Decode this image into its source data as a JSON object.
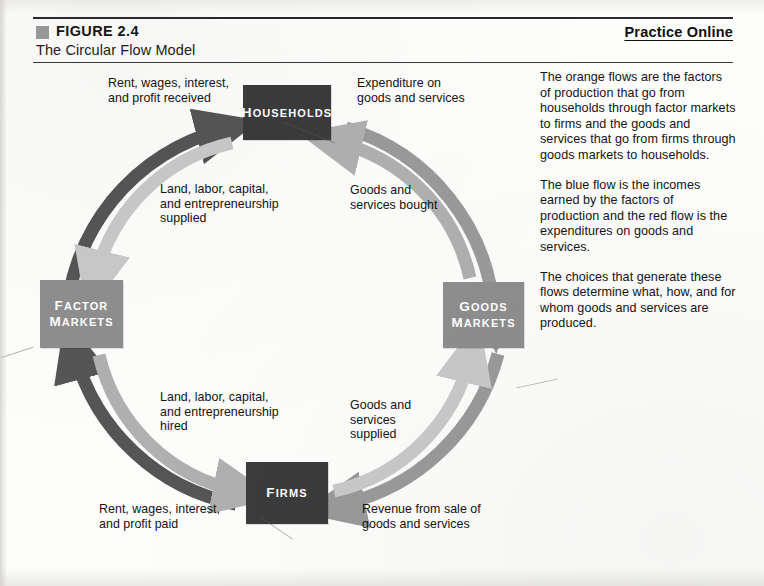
{
  "header": {
    "figure_label": "FIGURE 2.4",
    "figure_title": "The Circular Flow Model",
    "practice_online": "Practice Online"
  },
  "caption": {
    "paragraphs": [
      "The orange flows are the factors of production that go from households through factor markets to firms and the goods and services that go from firms through goods markets to households.",
      "The blue flow is the incomes earned by the factors of production and the red flow is the expenditures on goods and services.",
      "The choices that generate these flows determine what, how, and for whom goods and services are produced."
    ]
  },
  "diagram": {
    "nodes": {
      "households": "HOUSEHOLDS",
      "factor_markets": "FACTOR\nMARKETS",
      "goods_markets": "GOODS\nMARKETS",
      "firms": "FIRMS"
    },
    "flow_labels": {
      "rent_received": "Rent, wages, interest,\nand profit received",
      "expenditure": "Expenditure on\ngoods and services",
      "land_supplied": "Land, labor, capital,\nand entrepreneurship\nsupplied",
      "goods_bought": "Goods and\nservices bought",
      "land_hired": "Land, labor, capital,\nand entrepreneurship\nhired",
      "goods_supplied": "Goods and\nservices\nsupplied",
      "rent_paid": "Rent, wages, interest,\nand profit paid",
      "revenue": "Revenue from sale of\ngoods and services"
    },
    "colors": {
      "income_flow_blue": "#555555",
      "expenditure_flow_red": "#9a9a9a",
      "factors_flow_orange": "#c9c9c9",
      "goods_flow_orange": "#b0b0b0",
      "node_dark": "#3b3b3b",
      "node_mid": "#8e8e8e",
      "figure_marker": "#9a9a9a"
    }
  }
}
